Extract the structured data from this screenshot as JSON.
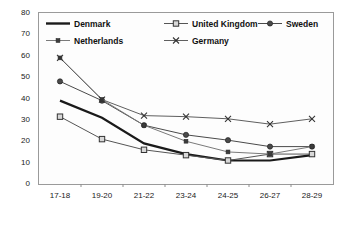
{
  "chart_data": {
    "type": "line",
    "title": "",
    "xlabel": "",
    "ylabel": "",
    "categories": [
      "17-18",
      "19-20",
      "21-22",
      "23-24",
      "24-25",
      "26-27",
      "28-29"
    ],
    "ylim": [
      0,
      80
    ],
    "ytick_labels": [
      "0",
      "10",
      "20",
      "30",
      "40",
      "50",
      "60",
      "70",
      "80"
    ],
    "yticks": [
      0,
      10,
      20,
      30,
      40,
      50,
      60,
      70,
      80
    ],
    "grid": false,
    "legend_position": "top-inside",
    "series": [
      {
        "name": "Denmark",
        "marker": "none",
        "color": "#1a1a1a",
        "values": [
          39,
          31,
          19,
          14,
          11,
          11,
          13.5
        ]
      },
      {
        "name": "United Kingdom",
        "marker": "square-open",
        "color": "#555555",
        "values": [
          31.5,
          21,
          16,
          13.5,
          11,
          14,
          14
        ]
      },
      {
        "name": "Sweden",
        "marker": "circle-filled",
        "color": "#4a4a4a",
        "values": [
          48,
          39,
          27.5,
          23,
          20.5,
          17.5,
          17.5
        ]
      },
      {
        "name": "Netherlands",
        "marker": "square-small",
        "color": "#7a7a7a",
        "values": [
          59,
          39.5,
          27.5,
          20,
          15,
          14,
          17.5
        ]
      },
      {
        "name": "Germany",
        "marker": "cross",
        "color": "#5f5f5f",
        "values": [
          59,
          39.5,
          32,
          31.5,
          30.5,
          28,
          30.5
        ]
      }
    ]
  },
  "legend": {
    "rows": [
      [
        "Denmark",
        "United Kingdom",
        "Sweden"
      ],
      [
        "Netherlands",
        "Germany"
      ]
    ]
  }
}
